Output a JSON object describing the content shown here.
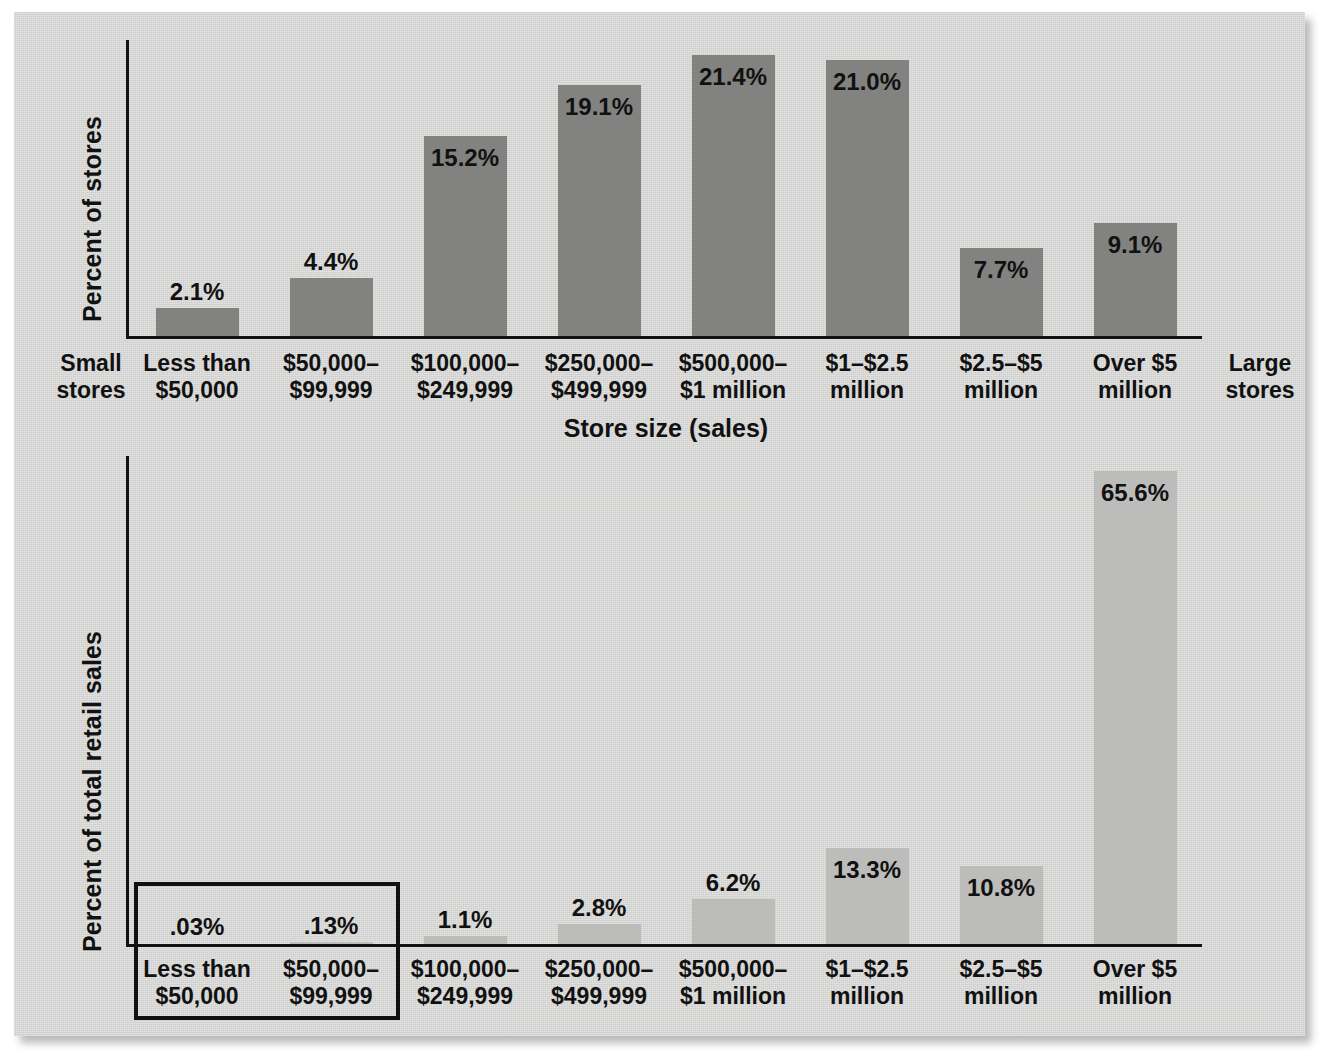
{
  "figure": {
    "background_color": "#d3d4d2",
    "top_chart": {
      "ylabel": "Percent of stores",
      "xlabel": "Store size (sales)",
      "left_note_line1": "Small",
      "left_note_line2": "stores",
      "right_note_line1": "Large",
      "right_note_line2": "stores",
      "bar_color": "#828281"
    },
    "bottom_chart": {
      "ylabel": "Percent of total retail sales",
      "bar_color": "#bcbdbb"
    }
  },
  "categories": [
    {
      "line1": "Less than",
      "line2": "$50,000"
    },
    {
      "line1": "$50,000–",
      "line2": "$99,999"
    },
    {
      "line1": "$100,000–",
      "line2": "$249,999"
    },
    {
      "line1": "$250,000–",
      "line2": "$499,999"
    },
    {
      "line1": "$500,000–",
      "line2": "$1 million"
    },
    {
      "line1": "$1–$2.5",
      "line2": "million"
    },
    {
      "line1": "$2.5–$5",
      "line2": "million"
    },
    {
      "line1": "Over $5",
      "line2": "million"
    }
  ],
  "chart_data": [
    {
      "type": "bar",
      "title": "Percent of stores by store size",
      "xlabel": "Store size (sales)",
      "ylabel": "Percent of stores",
      "categories": [
        "Less than $50,000",
        "$50,000–$99,999",
        "$100,000–$249,999",
        "$250,000–$499,999",
        "$500,000–$1 million",
        "$1–$2.5 million",
        "$2.5–$5 million",
        "Over $5 million"
      ],
      "values": [
        2.1,
        4.4,
        15.2,
        19.1,
        21.4,
        21.0,
        7.7,
        9.1
      ],
      "value_labels": [
        "2.1%",
        "4.4%",
        "15.2%",
        "19.1%",
        "21.4%",
        "21.0%",
        "7.7%",
        "9.1%"
      ],
      "ylim": [
        0,
        22.5
      ],
      "grid": false,
      "legend": "none",
      "annotations": [
        "Small stores",
        "Large stores"
      ]
    },
    {
      "type": "bar",
      "title": "Percent of total retail sales by store size",
      "xlabel": "",
      "ylabel": "Percent of total retail sales",
      "categories": [
        "Less than $50,000",
        "$50,000–$99,999",
        "$100,000–$249,999",
        "$250,000–$499,999",
        "$500,000–$1 million",
        "$1–$2.5 million",
        "$2.5–$5 million",
        "Over $5 million"
      ],
      "values": [
        0.03,
        0.13,
        1.1,
        2.8,
        6.2,
        13.3,
        10.8,
        65.6
      ],
      "value_labels": [
        ".03%",
        ".13%",
        "1.1%",
        "2.8%",
        "6.2%",
        "13.3%",
        "10.8%",
        "65.6%"
      ],
      "ylim": [
        0,
        68
      ],
      "grid": false,
      "legend": "none",
      "annotations": [
        "highlight box around first two categories"
      ]
    }
  ]
}
